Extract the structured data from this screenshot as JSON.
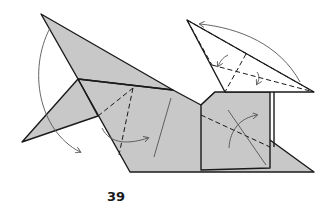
{
  "diagram": {
    "step_number": "39",
    "colors": {
      "paper_colored": "#c8c8c8",
      "paper_white": "#ffffff",
      "line": "#1a1a1a",
      "arrow": "#555555"
    },
    "elements": [
      "left-top-flap",
      "left-bottom-flap",
      "body",
      "right-white-flap",
      "square-flap",
      "valley-fold-lines",
      "fold-arrows"
    ]
  }
}
